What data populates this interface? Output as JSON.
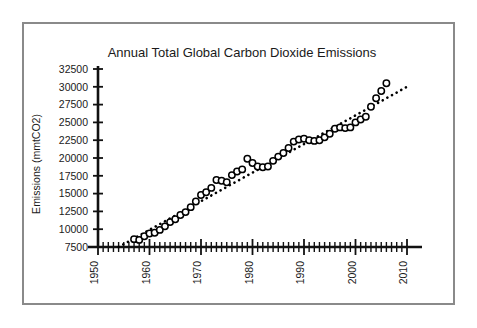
{
  "chart_data": {
    "type": "scatter",
    "title": "Annual Total Global Carbon Dioxide Emissions",
    "xlabel": "",
    "ylabel": "Emissions (mmtCO2)",
    "xlim": [
      1950,
      2010
    ],
    "ylim": [
      7500,
      32500
    ],
    "x_tick_labels": [
      "1950",
      "1960",
      "1970",
      "1980",
      "1990",
      "2000",
      "2010"
    ],
    "x_major_ticks": [
      1950,
      1960,
      1970,
      1980,
      1990,
      2000,
      2010
    ],
    "x_minor_tick_interval": 1,
    "y_tick_labels": [
      "7500",
      "10000",
      "12500",
      "15000",
      "17500",
      "20000",
      "22500",
      "25000",
      "27500",
      "30000",
      "32500"
    ],
    "y_ticks": [
      7500,
      10000,
      12500,
      15000,
      17500,
      20000,
      22500,
      25000,
      27500,
      30000,
      32500
    ],
    "grid": false,
    "legend": null,
    "marker_style": "open-circle",
    "series": [
      {
        "name": "Annual total global CO2 emissions",
        "x": [
          1957,
          1958,
          1959,
          1960,
          1961,
          1962,
          1963,
          1964,
          1965,
          1966,
          1967,
          1968,
          1969,
          1970,
          1971,
          1972,
          1973,
          1974,
          1975,
          1976,
          1977,
          1978,
          1979,
          1980,
          1981,
          1982,
          1983,
          1984,
          1985,
          1986,
          1987,
          1988,
          1989,
          1990,
          1991,
          1992,
          1993,
          1994,
          1995,
          1996,
          1997,
          1998,
          1999,
          2000,
          2001,
          2002,
          2003,
          2004,
          2005,
          2006
        ],
        "y": [
          8600,
          8500,
          9000,
          9400,
          9500,
          9900,
          10400,
          11000,
          11400,
          12000,
          12400,
          13100,
          13900,
          14800,
          15200,
          15800,
          16900,
          16800,
          16600,
          17600,
          18100,
          18400,
          19900,
          19300,
          18800,
          18700,
          18800,
          19600,
          20200,
          20700,
          21400,
          22300,
          22600,
          22700,
          22500,
          22400,
          22500,
          22900,
          23400,
          24100,
          24300,
          24200,
          24300,
          25000,
          25400,
          25800,
          27200,
          28400,
          29400,
          30500
        ]
      }
    ],
    "trendline": {
      "name": "linear trend",
      "style": "dotted",
      "x": [
        1954,
        2010
      ],
      "y": [
        7500,
        30000
      ]
    }
  },
  "figure": {
    "border_color": "#8a8a8a",
    "background": "#ffffff",
    "marker_color": "#000000",
    "axis_color": "#111111"
  }
}
